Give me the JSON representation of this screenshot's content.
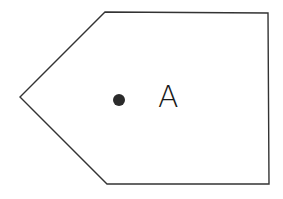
{
  "diagram": {
    "shape": {
      "type": "pentagon",
      "points": [
        [
          105,
          12
        ],
        [
          268,
          13
        ],
        [
          269,
          184
        ],
        [
          107,
          184
        ],
        [
          20,
          97
        ]
      ],
      "stroke": "#333333",
      "fill": "#ffffff"
    },
    "point": {
      "cx": 119,
      "cy": 100,
      "r": 6,
      "fill": "#2b2b2b"
    },
    "label": {
      "text": "A",
      "x": 158,
      "y": 107
    }
  }
}
